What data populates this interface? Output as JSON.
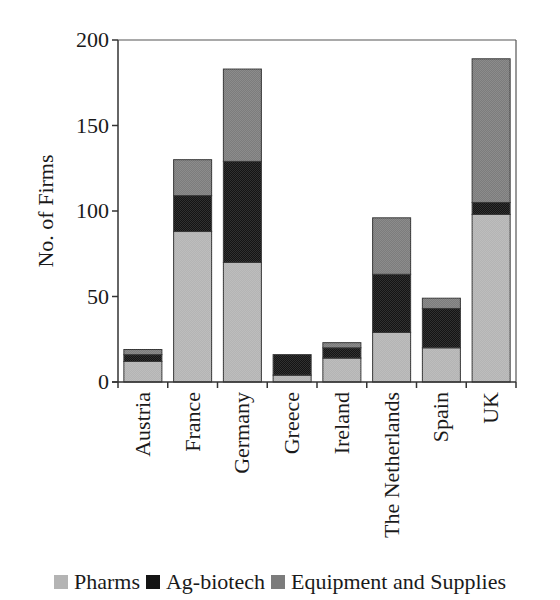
{
  "chart_data": {
    "type": "bar",
    "stacked": true,
    "title": "",
    "xlabel": "",
    "ylabel": "No. of Firms",
    "ylim": [
      0,
      200
    ],
    "yticks": [
      0,
      50,
      100,
      150,
      200
    ],
    "grid": false,
    "legend_position": "bottom",
    "categories": [
      "Austria",
      "France",
      "Germany",
      "Greece",
      "Ireland",
      "The Netherlands",
      "Spain",
      "UK"
    ],
    "series": [
      {
        "name": "Pharms",
        "color": "#b4b4b4",
        "values": [
          12,
          88,
          70,
          4,
          14,
          29,
          20,
          98
        ]
      },
      {
        "name": "Ag-biotech",
        "color": "#141414",
        "values": [
          4,
          21,
          59,
          12,
          6,
          34,
          23,
          7
        ]
      },
      {
        "name": "Equipment and Supplies",
        "color": "#7c7c7c",
        "values": [
          3,
          21,
          54,
          0,
          3,
          33,
          6,
          84
        ]
      }
    ]
  },
  "legend": {
    "items": [
      {
        "label": "Pharms",
        "color": "#b4b4b4"
      },
      {
        "label": "Ag-biotech",
        "color": "#141414"
      },
      {
        "label": "Equipment and Supplies",
        "color": "#7c7c7c"
      }
    ]
  }
}
